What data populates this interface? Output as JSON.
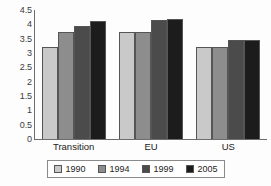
{
  "chart_data": {
    "type": "bar",
    "title": "",
    "subtitle": "",
    "xlabel": "",
    "ylabel": "",
    "categories": [
      "Transition",
      "EU",
      "US"
    ],
    "series": [
      {
        "name": "1990",
        "values": [
          3.2,
          3.75,
          3.2
        ],
        "color": "#c9c9c9"
      },
      {
        "name": "1994",
        "values": [
          3.75,
          3.75,
          3.2
        ],
        "color": "#8d8d8d"
      },
      {
        "name": "1999",
        "values": [
          3.95,
          4.15,
          3.45
        ],
        "color": "#4b4b4b"
      },
      {
        "name": "2005",
        "values": [
          4.1,
          4.2,
          3.45
        ],
        "color": "#1c1c1c"
      }
    ],
    "ylim": [
      0,
      4.5
    ],
    "ytick_values": [
      0,
      0.5,
      1,
      1.5,
      2,
      2.5,
      3,
      3.5,
      4,
      4.5
    ],
    "ytick_labels": [
      "0",
      "0.5",
      "1",
      "1.5",
      "2",
      "2.5",
      "3",
      "3.5",
      "4",
      "4.5"
    ],
    "grid": false,
    "legend_position": "bottom",
    "orientation": "vertical",
    "bar_group_gap": true
  },
  "axes": {
    "y_tick_labels": [
      "4.5",
      "4",
      "3.5",
      "3",
      "2.5",
      "2",
      "1.5",
      "1",
      "0.5",
      "0"
    ],
    "x_category_labels": [
      "Transition",
      "EU",
      "US"
    ]
  },
  "legend": {
    "entries": [
      {
        "label": "1990",
        "color": "#c9c9c9"
      },
      {
        "label": "1994",
        "color": "#8d8d8d"
      },
      {
        "label": "1999",
        "color": "#4b4b4b"
      },
      {
        "label": "2005",
        "color": "#1c1c1c"
      }
    ]
  },
  "style": {
    "axis_color": "#6d6d6d",
    "legend_border": "#8a8a8a",
    "background": "#fdfdfd",
    "text_color": "#222222"
  }
}
